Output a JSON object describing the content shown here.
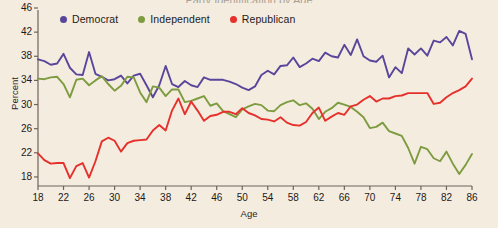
{
  "figure": {
    "background_color": "#f5ece0",
    "cropped_title": "Party Identification by Age"
  },
  "axes": {
    "ylabel": "Percent",
    "xlabel": "Age",
    "yticks": [
      18,
      22,
      26,
      30,
      34,
      38,
      42,
      46
    ],
    "xticks": [
      18,
      22,
      26,
      30,
      34,
      38,
      42,
      46,
      50,
      54,
      58,
      62,
      66,
      70,
      74,
      78,
      82,
      86
    ]
  },
  "legend": {
    "position": "top-center",
    "items": [
      {
        "label": "Democrat",
        "color": "#59469b"
      },
      {
        "label": "Independent",
        "color": "#7d9c3f"
      },
      {
        "label": "Republican",
        "color": "#e5302b"
      }
    ]
  },
  "chart_data": {
    "type": "line",
    "title": "Party Identification by Age",
    "xlabel": "Age",
    "ylabel": "Percent",
    "xlim": [
      18,
      86
    ],
    "ylim": [
      16.5,
      46
    ],
    "grid": false,
    "legend_position": "top-center",
    "x": [
      18,
      19,
      20,
      21,
      22,
      23,
      24,
      25,
      26,
      27,
      28,
      29,
      30,
      31,
      32,
      33,
      34,
      35,
      36,
      37,
      38,
      39,
      40,
      41,
      42,
      43,
      44,
      45,
      46,
      47,
      48,
      49,
      50,
      51,
      52,
      53,
      54,
      55,
      56,
      57,
      58,
      59,
      60,
      61,
      62,
      63,
      64,
      65,
      66,
      67,
      68,
      69,
      70,
      71,
      72,
      73,
      74,
      75,
      76,
      77,
      78,
      79,
      80,
      81,
      82,
      83,
      84,
      85,
      86
    ],
    "series": [
      {
        "name": "Democrat",
        "color": "#59469b",
        "values": [
          37.5,
          37.2,
          36.6,
          36.8,
          38.4,
          36.1,
          35.0,
          34.9,
          38.7,
          35.1,
          34.6,
          34.0,
          34.2,
          34.8,
          33.5,
          34.8,
          35.1,
          33.2,
          31.2,
          33.2,
          36.4,
          33.4,
          32.9,
          33.9,
          33.2,
          32.9,
          34.5,
          34.1,
          34.1,
          34.1,
          33.8,
          33.4,
          32.8,
          32.4,
          33.0,
          34.9,
          35.6,
          35.0,
          36.4,
          36.5,
          37.8,
          36.2,
          36.8,
          37.6,
          37.2,
          38.6,
          38.0,
          37.8,
          39.9,
          38.2,
          40.8,
          38.0,
          37.3,
          37.1,
          38.1,
          34.5,
          36.2,
          35.2,
          39.3,
          38.3,
          39.3,
          38.1,
          40.6,
          40.3,
          41.2,
          39.8,
          42.2,
          41.7,
          37.5
        ]
      },
      {
        "name": "Independent",
        "color": "#7d9c3f",
        "values": [
          34.3,
          34.2,
          34.5,
          34.6,
          33.4,
          31.2,
          34.1,
          34.3,
          33.2,
          34.0,
          34.7,
          33.4,
          32.3,
          33.1,
          34.6,
          34.5,
          32.0,
          30.4,
          33.0,
          32.8,
          31.4,
          32.5,
          32.5,
          30.4,
          30.6,
          31.0,
          31.4,
          29.8,
          30.2,
          28.9,
          28.4,
          27.9,
          29.2,
          29.7,
          30.1,
          29.9,
          29.0,
          28.9,
          29.9,
          30.4,
          30.7,
          29.9,
          30.2,
          29.3,
          27.6,
          28.8,
          29.4,
          30.3,
          30.0,
          29.6,
          28.8,
          27.9,
          26.1,
          26.3,
          27.0,
          25.6,
          25.2,
          24.8,
          22.8,
          20.2,
          23.0,
          22.6,
          21.1,
          20.6,
          22.2,
          20.2,
          18.5,
          20.0,
          21.8
        ]
      },
      {
        "name": "Republican",
        "color": "#e5302b",
        "values": [
          21.9,
          20.8,
          20.2,
          20.3,
          20.3,
          17.8,
          19.8,
          20.3,
          17.9,
          20.6,
          23.9,
          24.5,
          24.0,
          22.2,
          23.6,
          24.0,
          24.1,
          24.2,
          25.7,
          26.6,
          25.7,
          29.0,
          31.0,
          28.4,
          30.5,
          29.0,
          27.3,
          28.1,
          28.3,
          28.8,
          28.8,
          28.4,
          29.4,
          28.6,
          28.2,
          27.6,
          27.5,
          27.2,
          27.9,
          27.0,
          26.6,
          26.5,
          27.1,
          28.6,
          29.5,
          27.3,
          28.0,
          28.6,
          28.3,
          29.7,
          30.0,
          30.8,
          31.4,
          30.5,
          31.0,
          31.0,
          31.4,
          31.5,
          31.9,
          31.9,
          31.9,
          31.9,
          30.1,
          30.3,
          31.2,
          31.9,
          32.4,
          33.0,
          34.3
        ]
      }
    ]
  }
}
